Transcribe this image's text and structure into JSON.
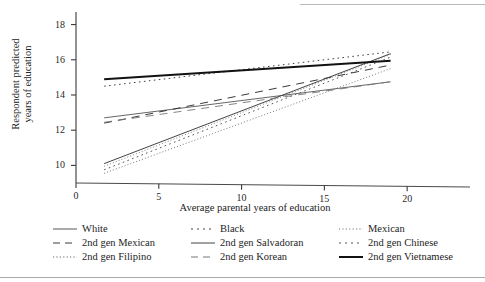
{
  "chart_data": {
    "type": "line",
    "title": "",
    "xlabel": "Average parental years of education",
    "ylabel_lines": [
      "Respondent predicted",
      "years of education"
    ],
    "ylabel": "Respondent predicted years of education",
    "xlim": [
      0,
      21.5
    ],
    "ylim": [
      9.0,
      18.6
    ],
    "xticks": [
      0,
      5,
      10,
      15,
      20
    ],
    "yticks": [
      10,
      12,
      14,
      16,
      18
    ],
    "grid": false,
    "legend_position": "below-plot",
    "x": [
      1.7,
      19.0
    ],
    "series": [
      {
        "name": "White",
        "style": "solid",
        "color": "#555555",
        "width": 0.9,
        "values": [
          12.7,
          14.75
        ]
      },
      {
        "name": "Black",
        "style": "dotted-wide",
        "color": "#444444",
        "width": 1.0,
        "values": [
          14.5,
          16.45
        ]
      },
      {
        "name": "Mexican",
        "style": "dotted-fine",
        "color": "#777777",
        "width": 0.9,
        "values": [
          9.95,
          16.3
        ]
      },
      {
        "name": "2nd gen Mexican",
        "style": "dashed-long",
        "color": "#3a3a3a",
        "width": 1.0,
        "values": [
          12.4,
          15.7
        ]
      },
      {
        "name": "2nd gen Salvadoran",
        "style": "solid",
        "color": "#444444",
        "width": 1.0,
        "values": [
          10.1,
          16.35
        ]
      },
      {
        "name": "2nd gen Chinese",
        "style": "dotted-wide",
        "color": "#555555",
        "width": 1.0,
        "values": [
          9.75,
          16.15
        ]
      },
      {
        "name": "2nd gen Filipino",
        "style": "dotted-fine",
        "color": "#666666",
        "width": 0.9,
        "values": [
          9.55,
          15.5
        ]
      },
      {
        "name": "2nd gen Korean",
        "style": "dashed-long",
        "color": "#777777",
        "width": 0.9,
        "values": [
          12.45,
          14.75
        ]
      },
      {
        "name": "2nd gen Vietnamese",
        "style": "solid-bold",
        "color": "#121212",
        "width": 2.0,
        "values": [
          14.9,
          15.95
        ]
      }
    ]
  },
  "legend": {
    "rows": [
      [
        {
          "label": "White",
          "series": 0
        },
        {
          "label": "Black",
          "series": 1
        },
        {
          "label": "Mexican",
          "series": 2
        }
      ],
      [
        {
          "label": "2nd gen Mexican",
          "series": 3
        },
        {
          "label": "2nd gen Salvadoran",
          "series": 4
        },
        {
          "label": "2nd gen Chinese",
          "series": 5
        }
      ],
      [
        {
          "label": "2nd gen Filipino",
          "series": 6
        },
        {
          "label": "2nd gen Korean",
          "series": 7
        },
        {
          "label": "2nd gen Vietnamese",
          "series": 8
        }
      ]
    ]
  }
}
